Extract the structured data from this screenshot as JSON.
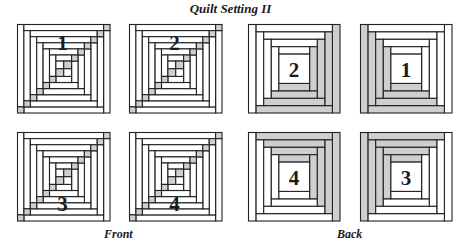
{
  "title": "Quilt Setting II",
  "colors": {
    "shaded": "#cfcfcf",
    "plain": "#ffffff",
    "outline": "#222222"
  },
  "front": {
    "caption": "Front",
    "blocks": [
      {
        "label": "1",
        "label_position": "top"
      },
      {
        "label": "2",
        "label_position": "top"
      },
      {
        "label": "3",
        "label_position": "bottom"
      },
      {
        "label": "4",
        "label_position": "bottom"
      }
    ]
  },
  "back": {
    "caption": "Back",
    "blocks": [
      {
        "label": "2",
        "shaded_sides": [
          "right",
          "bottom"
        ]
      },
      {
        "label": "1",
        "shaded_sides": [
          "left",
          "bottom"
        ]
      },
      {
        "label": "4",
        "shaded_sides": [
          "top",
          "right"
        ]
      },
      {
        "label": "3",
        "shaded_sides": [
          "top",
          "left"
        ]
      }
    ]
  }
}
